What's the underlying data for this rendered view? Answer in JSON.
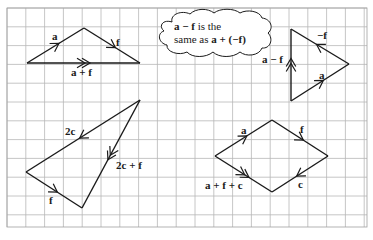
{
  "grid": {
    "x0": 7,
    "y0": 8,
    "x1": 367,
    "y1": 227,
    "cell": 18.8,
    "line_color": "#b8b8b8",
    "border_color": "#a0a0a0"
  },
  "colors": {
    "stroke": "#1a1a1a",
    "cloud_fill": "#ffffff"
  },
  "diagrams": {
    "triangle_sum": {
      "vectors": [
        {
          "name": "a",
          "from": [
            27,
            63
          ],
          "to": [
            84,
            28
          ],
          "arrows": 1
        },
        {
          "name": "f",
          "from": [
            84,
            28
          ],
          "to": [
            140,
            63
          ],
          "arrows": 1
        },
        {
          "name": "a + f",
          "from": [
            27,
            63
          ],
          "to": [
            140,
            63
          ],
          "arrows": 2
        }
      ],
      "labels": {
        "a": "a",
        "f": "f",
        "sum": "a + f"
      }
    },
    "note": {
      "line1_bold": "a − f",
      "line1_rest": " is the",
      "line2_start": "same as ",
      "line2_bold": "a + (−f)"
    },
    "triangle_difference": {
      "vectors": [
        {
          "name": "a",
          "from": [
            291,
            101
          ],
          "to": [
            349,
            64
          ],
          "arrows": 1
        },
        {
          "name": "-f",
          "from": [
            349,
            64
          ],
          "to": [
            291,
            29
          ],
          "arrows": 1
        },
        {
          "name": "a − f",
          "from": [
            291,
            101
          ],
          "to": [
            291,
            29
          ],
          "arrows": 2
        }
      ],
      "labels": {
        "neg_f": "−f",
        "a": "a",
        "diff": "a − f"
      }
    },
    "triangle_2c": {
      "vectors": [
        {
          "name": "2c",
          "from": [
            140,
            100
          ],
          "to": [
            26,
            172
          ],
          "arrows": 1
        },
        {
          "name": "f",
          "from": [
            26,
            172
          ],
          "to": [
            82,
            208
          ],
          "arrows": 1
        },
        {
          "name": "2c + f",
          "from": [
            140,
            100
          ],
          "to": [
            82,
            208
          ],
          "arrows": 2
        }
      ],
      "labels": {
        "two_c": "2c",
        "f": "f",
        "sum": "2c + f"
      }
    },
    "rhombus": {
      "vectors": [
        {
          "name": "a",
          "from": [
            215,
            156
          ],
          "to": [
            272,
            120
          ],
          "arrows": 1
        },
        {
          "name": "f",
          "from": [
            272,
            120
          ],
          "to": [
            328,
            156
          ],
          "arrows": 1
        },
        {
          "name": "c",
          "from": [
            328,
            156
          ],
          "to": [
            272,
            192
          ],
          "arrows": 1
        },
        {
          "name": "a + f + c",
          "from": [
            215,
            156
          ],
          "to": [
            272,
            192
          ],
          "arrows": 2
        }
      ],
      "labels": {
        "a": "a",
        "f": "f",
        "c": "c",
        "sum": "a + f + c"
      }
    }
  }
}
